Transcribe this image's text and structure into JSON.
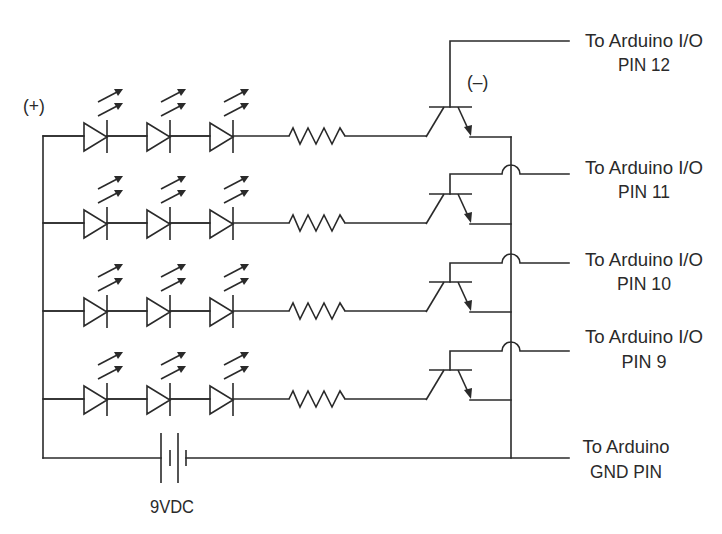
{
  "diagram": {
    "type": "circuit-schematic",
    "polarity": {
      "positive_label": "(+)",
      "negative_label": "(–)"
    },
    "battery": {
      "label": "9VDC"
    },
    "rows": [
      {
        "row": 1,
        "leds": 3,
        "resistor": true,
        "transistor": "npn",
        "output_label_line1": "To Arduino I/O",
        "output_label_line2": "PIN 12"
      },
      {
        "row": 2,
        "leds": 3,
        "resistor": true,
        "transistor": "npn",
        "output_label_line1": "To Arduino I/O",
        "output_label_line2": "PIN 11"
      },
      {
        "row": 3,
        "leds": 3,
        "resistor": true,
        "transistor": "npn",
        "output_label_line1": "To Arduino I/O",
        "output_label_line2": "PIN 10"
      },
      {
        "row": 4,
        "leds": 3,
        "resistor": true,
        "transistor": "npn",
        "output_label_line1": "To Arduino I/O",
        "output_label_line2": "PIN 9"
      }
    ],
    "ground": {
      "label_line1": "To Arduino",
      "label_line2": "GND PIN"
    },
    "colors": {
      "ink": "#2a2a2a",
      "background": "#ffffff"
    }
  }
}
